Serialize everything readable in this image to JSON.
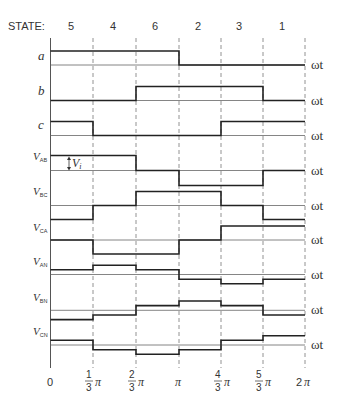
{
  "header": {
    "state_label": "STATE:"
  },
  "states": [
    "5",
    "4",
    "6",
    "2",
    "3",
    "1"
  ],
  "x_axis": {
    "variable": "ωt",
    "ticks": [
      {
        "whole": "0"
      },
      {
        "num": "1",
        "den": "3",
        "sym": "π"
      },
      {
        "num": "2",
        "den": "3",
        "sym": "π"
      },
      {
        "whole": "π"
      },
      {
        "num": "4",
        "den": "3",
        "sym": "π"
      },
      {
        "num": "5",
        "den": "3",
        "sym": "π"
      },
      {
        "whole": "2",
        "sym": "π"
      }
    ]
  },
  "annotation": {
    "label": "V",
    "sub": "i"
  },
  "colors": {
    "trace": "#222222",
    "axis": "#555555",
    "grid": "#777777"
  },
  "traces": [
    {
      "name": "a",
      "sub": "",
      "levels": [
        1,
        1,
        1,
        0,
        0,
        0
      ]
    },
    {
      "name": "b",
      "sub": "",
      "levels": [
        0,
        0,
        1,
        1,
        1,
        0
      ]
    },
    {
      "name": "c",
      "sub": "",
      "levels": [
        1,
        0,
        0,
        0,
        1,
        1
      ]
    },
    {
      "name": "V",
      "sub": "AB",
      "levels": [
        1,
        1,
        0,
        -1,
        -1,
        0
      ]
    },
    {
      "name": "V",
      "sub": "BC",
      "levels": [
        -1,
        0,
        1,
        1,
        0,
        -1
      ]
    },
    {
      "name": "V",
      "sub": "CA",
      "levels": [
        0,
        -1,
        -1,
        0,
        1,
        1
      ]
    },
    {
      "name": "V",
      "sub": "AN",
      "levels": [
        0.333,
        0.667,
        0.333,
        -0.333,
        -0.667,
        -0.333
      ]
    },
    {
      "name": "V",
      "sub": "BN",
      "levels": [
        -0.667,
        -0.333,
        0.333,
        0.667,
        0.333,
        -0.333
      ]
    },
    {
      "name": "V",
      "sub": "CN",
      "levels": [
        0.333,
        -0.333,
        -0.667,
        -0.333,
        0.333,
        0.667
      ]
    }
  ]
}
